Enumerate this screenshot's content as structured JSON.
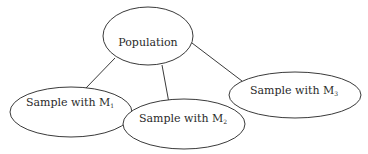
{
  "diagram": {
    "type": "tree",
    "nodes": [
      {
        "id": "population",
        "label": "Population",
        "subscript": ""
      },
      {
        "id": "m1",
        "label": "Sample with M",
        "subscript": "1"
      },
      {
        "id": "m2",
        "label": "Sample with M",
        "subscript": "2"
      },
      {
        "id": "m3",
        "label": "Sample with M",
        "subscript": "3"
      }
    ],
    "edges": [
      {
        "from": "population",
        "to": "m1"
      },
      {
        "from": "population",
        "to": "m2"
      },
      {
        "from": "population",
        "to": "m3"
      }
    ]
  },
  "colors": {
    "stroke": "#3a3a3a",
    "text": "#2a2a2a",
    "background": "#ffffff"
  }
}
